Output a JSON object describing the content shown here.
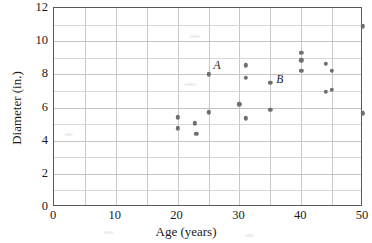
{
  "chart_data": {
    "type": "scatter",
    "title": "",
    "xlabel": "Age (years)",
    "ylabel": "Diameter (in.)",
    "xlim": [
      0,
      50
    ],
    "ylim": [
      0,
      12
    ],
    "x_ticks": [
      0,
      10,
      20,
      30,
      40,
      50
    ],
    "y_ticks": [
      0,
      2,
      4,
      6,
      8,
      10,
      12
    ],
    "x_tick_labels": [
      "0",
      "10",
      "20",
      "30",
      "40",
      "50"
    ],
    "y_tick_labels": [
      "0",
      "2",
      "4",
      "6",
      "8",
      "10",
      "12"
    ],
    "x_minor_step": 5,
    "y_minor_step": 1,
    "grid": true,
    "legend": null,
    "marker_color": "#6f6f72",
    "frame_color": "#595959",
    "grid_color": "#c9c9c9",
    "points": [
      {
        "x": 20,
        "y": 5.4
      },
      {
        "x": 20,
        "y": 4.75
      },
      {
        "x": 22.8,
        "y": 5.05
      },
      {
        "x": 23,
        "y": 4.4
      },
      {
        "x": 25,
        "y": 5.7
      },
      {
        "x": 25,
        "y": 8.0,
        "label": "A"
      },
      {
        "x": 30,
        "y": 6.2
      },
      {
        "x": 31,
        "y": 8.55
      },
      {
        "x": 31,
        "y": 7.8
      },
      {
        "x": 31,
        "y": 5.35
      },
      {
        "x": 35,
        "y": 7.5,
        "label": "B"
      },
      {
        "x": 35,
        "y": 5.85
      },
      {
        "x": 40,
        "y": 9.3
      },
      {
        "x": 40,
        "y": 8.85
      },
      {
        "x": 40,
        "y": 8.2
      },
      {
        "x": 44,
        "y": 8.65
      },
      {
        "x": 44,
        "y": 6.95
      },
      {
        "x": 45,
        "y": 8.2
      },
      {
        "x": 45,
        "y": 7.05
      },
      {
        "x": 50,
        "y": 10.9
      },
      {
        "x": 50,
        "y": 5.65
      }
    ],
    "annotations": [
      {
        "text": "A",
        "x": 25,
        "y": 8.0,
        "offset_px": [
          6,
          -7
        ]
      },
      {
        "text": "B",
        "x": 35,
        "y": 7.5,
        "offset_px": [
          7,
          -2
        ]
      }
    ]
  }
}
